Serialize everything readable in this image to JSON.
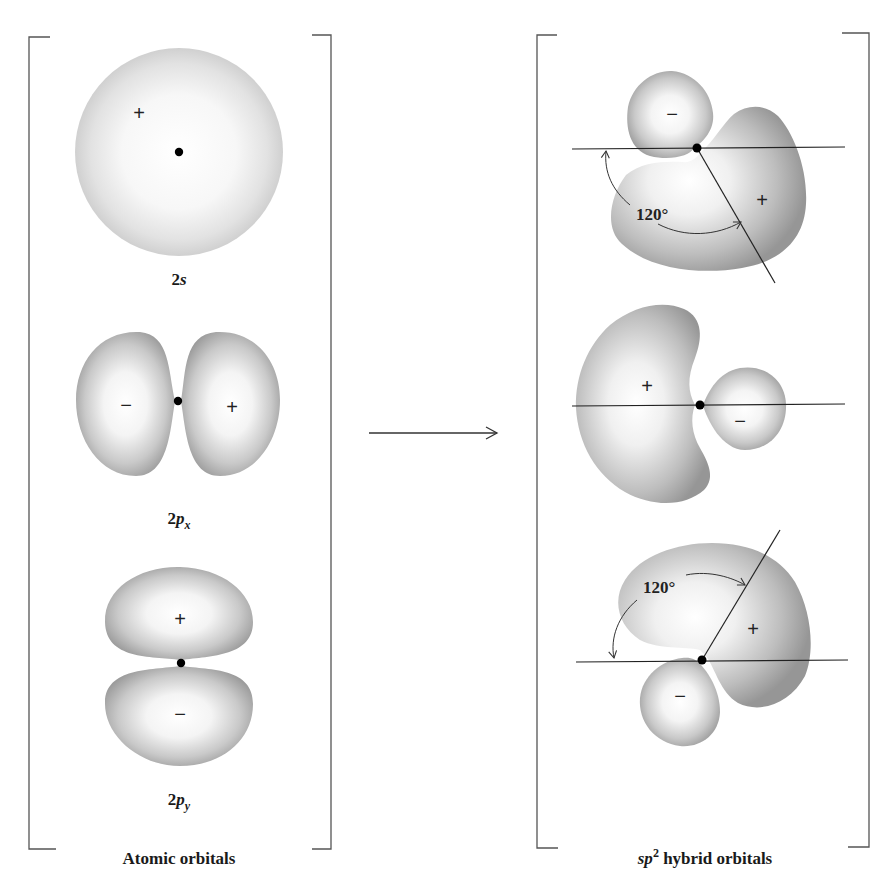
{
  "figure": {
    "left_panel": {
      "caption": "Atomic orbitals",
      "orbitals": [
        {
          "id": "2s",
          "label_main": "2",
          "label_italic": "s",
          "label_sub": "",
          "signs": [
            "+"
          ]
        },
        {
          "id": "2px",
          "label_main": "2",
          "label_italic": "p",
          "label_sub": "x",
          "signs": [
            "−",
            "+"
          ]
        },
        {
          "id": "2py",
          "label_main": "2",
          "label_italic": "p",
          "label_sub": "y",
          "signs": [
            "+",
            "−"
          ]
        }
      ]
    },
    "arrow": {
      "direction": "right"
    },
    "right_panel": {
      "caption_italic": "sp",
      "caption_sup": "2",
      "caption_rest": " hybrid orbitals",
      "hybrids": [
        {
          "id": "sp2-1",
          "large_lobe_sign": "+",
          "small_lobe_sign": "−",
          "angle_label": "120°"
        },
        {
          "id": "sp2-2",
          "large_lobe_sign": "+",
          "small_lobe_sign": "−"
        },
        {
          "id": "sp2-3",
          "large_lobe_sign": "+",
          "small_lobe_sign": "−",
          "angle_label": "120°"
        }
      ]
    },
    "colors": {
      "lobe_edge": "#9a9a9a",
      "lobe_center": "#ffffff",
      "sphere_edge": "#c8c8c8",
      "line": "#222222",
      "nucleus": "#000000"
    }
  }
}
